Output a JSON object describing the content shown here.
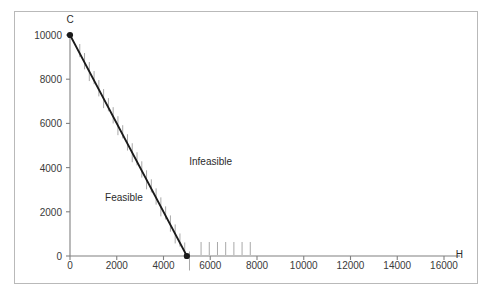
{
  "chart_data": {
    "type": "line",
    "title": "",
    "xlabel": "H",
    "ylabel": "C",
    "xlim": [
      0,
      16000
    ],
    "ylim": [
      0,
      10000
    ],
    "grid": false,
    "legend": null,
    "xticks": [
      0,
      2000,
      4000,
      6000,
      8000,
      10000,
      12000,
      14000,
      16000
    ],
    "xtick_labels": [
      "0",
      "2000",
      "4000",
      "6000",
      "8000",
      "10000",
      "12000",
      "14000",
      "16000"
    ],
    "yticks": [
      0,
      2000,
      4000,
      6000,
      8000,
      10000
    ],
    "ytick_labels": [
      "0",
      "2000",
      "4000",
      "6000",
      "8000",
      "10000"
    ],
    "series": [
      {
        "name": "constraint-line",
        "x": [
          0,
          5000
        ],
        "y": [
          10000,
          0
        ],
        "markers": [
          {
            "x": 0,
            "y": 10000
          },
          {
            "x": 5000,
            "y": 0
          }
        ]
      }
    ],
    "annotations": [
      {
        "name": "feasible-label",
        "text": "Feasible",
        "x": 1500,
        "y": 2600
      },
      {
        "name": "infeasible-label",
        "text": "Infeasible",
        "x": 5100,
        "y": 4200
      },
      {
        "name": "c-axis-label",
        "text": "C",
        "x": 0,
        "y": 10650
      },
      {
        "name": "h-axis-label",
        "text": "H",
        "x": 16500,
        "y": 0
      }
    ],
    "hatching": {
      "side": "infeasible",
      "description": "short vertical tick marks hanging on the upper-right side of the constraint line and along the x-axis beyond the intercept",
      "color": "#a8a8a8"
    }
  },
  "colors": {
    "line": "#1a1a1a",
    "axis": "#808080",
    "hatch": "#a8a8a8",
    "text": "#2b2b2b",
    "frame": "#b9b9b9",
    "background": "#ffffff"
  }
}
